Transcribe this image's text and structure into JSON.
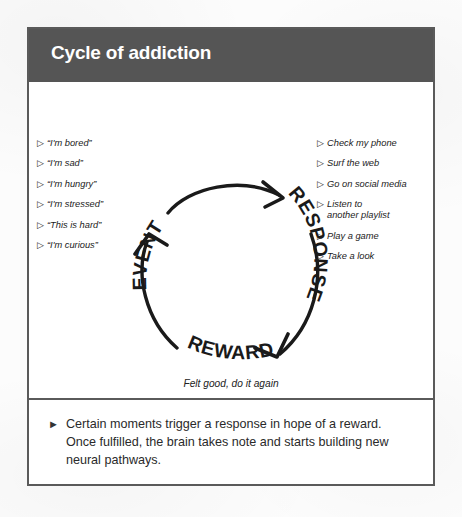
{
  "figure": {
    "header_title": "Cycle of addiction",
    "header_bg": "#555555",
    "header_text_color": "#ffffff",
    "border_color": "#5a5a5a",
    "panel_bg": "#ffffff"
  },
  "diagram": {
    "type": "cycle",
    "ink_color": "#1a1a1a",
    "stages": [
      {
        "label": "EVENT",
        "name": "stage-event"
      },
      {
        "label": "RESPONSE",
        "name": "stage-response"
      },
      {
        "label": "REWARD",
        "name": "stage-reward"
      }
    ],
    "reward_caption": "Felt good, do it again",
    "bullet_glyph": "▷"
  },
  "triggers": {
    "heading": "",
    "items": [
      "“I'm bored”",
      "“I'm sad”",
      "“I'm hungry”",
      "“I'm stressed”",
      "“This is hard”",
      "“I'm curious”"
    ]
  },
  "responses": {
    "heading": "",
    "items": [
      "Check my phone",
      "Surf the web",
      "Go on social media",
      "Listen to\nanother playlist",
      "Play a game",
      "Take a look"
    ]
  },
  "caption": {
    "bullet_glyph": "►",
    "text": "Certain moments trigger a response in hope of a reward. Once fulfilled, the brain takes note and starts building new neural pathways."
  }
}
